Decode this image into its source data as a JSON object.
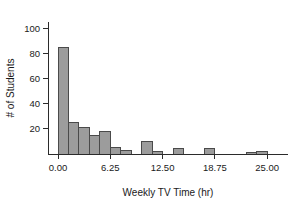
{
  "chart_data": {
    "type": "bar",
    "title": "",
    "subtitle": "",
    "xlabel": "Weekly TV Time (hr)",
    "ylabel": "# of Students",
    "xlim": [
      -1.2,
      27.5
    ],
    "ylim": [
      0,
      105
    ],
    "grid": false,
    "legend": null,
    "bin_width": 1.25,
    "bin_starts": [
      0,
      1.25,
      2.5,
      3.75,
      5,
      6.25,
      7.5,
      8.75,
      10,
      11.25,
      12.5,
      13.75,
      15,
      16.25,
      17.5,
      18.75,
      20,
      21.25,
      22.5,
      23.75,
      25
    ],
    "categories": [
      "0.00-1.25",
      "1.25-2.50",
      "2.50-3.75",
      "3.75-5.00",
      "5.00-6.25",
      "6.25-7.50",
      "7.50-8.75",
      "8.75-10.00",
      "10.00-11.25",
      "11.25-12.50",
      "12.50-13.75",
      "13.75-15.00",
      "15.00-16.25",
      "16.25-17.50",
      "17.50-18.75",
      "18.75-20.00",
      "20.00-21.25",
      "21.25-22.50",
      "22.50-23.75",
      "23.75-25.00",
      "25.00-26.25"
    ],
    "values": [
      85,
      25,
      21,
      15,
      18,
      5,
      3,
      0,
      10,
      2,
      0,
      4,
      0,
      0,
      4,
      0,
      0,
      0,
      1,
      2,
      0
    ],
    "xticks": [
      0,
      6.25,
      12.5,
      18.75,
      25
    ],
    "xtick_labels": [
      "0.00",
      "6.25",
      "12.50",
      "18.75",
      "25.00"
    ],
    "yticks": [
      20,
      40,
      60,
      80,
      100
    ],
    "ytick_labels": [
      "20",
      "40",
      "60",
      "80",
      "100"
    ],
    "bar_fill": "#9c9c9c",
    "bar_stroke": "#4a4a4a",
    "axis_color": "#2b2b2b"
  }
}
